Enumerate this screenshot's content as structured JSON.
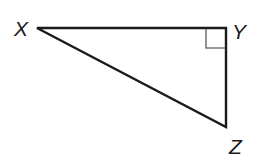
{
  "diagram": {
    "type": "right-triangle",
    "vertices": [
      {
        "label": "X",
        "x": 37,
        "y": 28
      },
      {
        "label": "Y",
        "x": 226,
        "y": 28
      },
      {
        "label": "Z",
        "x": 226,
        "y": 127
      }
    ],
    "right_angle_at": "Y",
    "colors": {
      "stroke": "#1a1a1a",
      "right_angle_marker": "#777777",
      "background": "#ffffff"
    }
  },
  "labels": {
    "x": "X",
    "y": "Y",
    "z": "Z"
  }
}
